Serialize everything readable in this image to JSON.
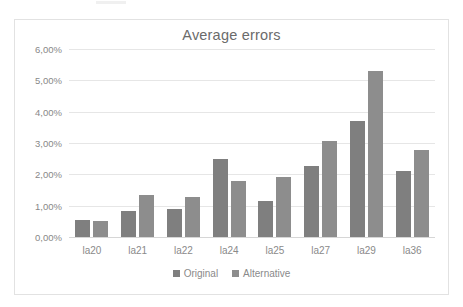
{
  "chart_data": {
    "type": "bar",
    "title": "Average errors",
    "xlabel": "",
    "ylabel": "",
    "categories": [
      "la20",
      "la21",
      "la22",
      "la24",
      "la25",
      "la27",
      "la29",
      "la36"
    ],
    "series": [
      {
        "name": "Original",
        "color": "#7f7f7f",
        "values": [
          0.55,
          0.82,
          0.88,
          2.5,
          1.15,
          2.28,
          3.7,
          2.1
        ]
      },
      {
        "name": "Alternative",
        "color": "#8d8d8d",
        "values": [
          0.5,
          1.35,
          1.27,
          1.8,
          1.93,
          3.06,
          5.3,
          2.78
        ]
      }
    ],
    "ylim": [
      0,
      6
    ],
    "ytick_values": [
      0,
      1,
      2,
      3,
      4,
      5,
      6
    ],
    "ytick_labels": [
      "0,00%",
      "1,00%",
      "2,00%",
      "3,00%",
      "4,00%",
      "5,00%",
      "6,00%"
    ],
    "grid": true,
    "legend_position": "bottom",
    "value_suffix": "%",
    "decimal_separator": ","
  }
}
